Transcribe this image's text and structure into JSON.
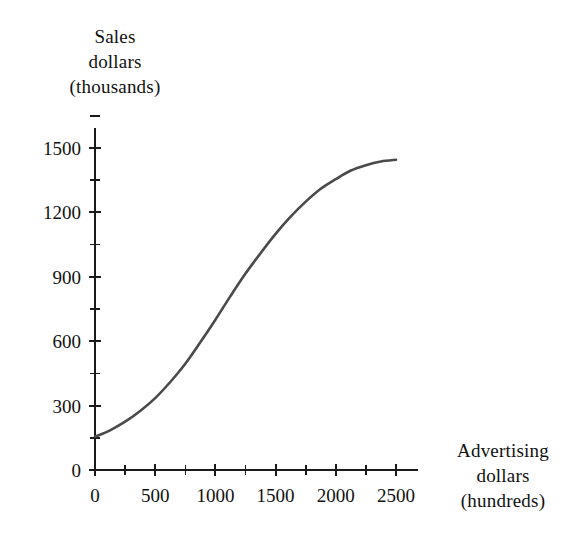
{
  "chart_data": {
    "type": "line",
    "title": "",
    "subtitle": "",
    "xlabel": "Advertising dollars (hundreds)",
    "ylabel": "Sales dollars (thousands)",
    "xlim": [
      0,
      2650
    ],
    "ylim": [
      0,
      1650
    ],
    "grid": false,
    "legend": null,
    "x_tick_labels": [
      "0",
      "500",
      "1000",
      "1500",
      "2000",
      "2500"
    ],
    "x_tick_values": [
      0,
      500,
      1000,
      1500,
      2000,
      2500
    ],
    "x_minor_tick_values": [
      250,
      750,
      1250,
      1750,
      2250
    ],
    "y_tick_labels": [
      "0",
      "300",
      "600",
      "900",
      "1200",
      "1500"
    ],
    "y_tick_values": [
      0,
      300,
      600,
      900,
      1200,
      1500
    ],
    "y_minor_tick_values": [
      150,
      450,
      750,
      1050,
      1350,
      1650
    ],
    "series": [
      {
        "name": "Sales response to advertising",
        "color": "#4a4a4a",
        "x": [
          0,
          125,
          250,
          375,
          500,
          625,
          750,
          875,
          1000,
          1125,
          1250,
          1375,
          1500,
          1625,
          1750,
          1875,
          2000,
          2125,
          2250,
          2375,
          2500
        ],
        "y": [
          155,
          185,
          225,
          275,
          335,
          410,
          495,
          595,
          700,
          810,
          915,
          1010,
          1100,
          1180,
          1250,
          1310,
          1355,
          1395,
          1420,
          1437,
          1445
        ]
      }
    ],
    "annotations": []
  },
  "labels": {
    "y_axis_title_lines": [
      "Sales",
      "dollars",
      "(thousands)"
    ],
    "x_axis_title_lines": [
      "Advertising",
      "dollars",
      "(hundreds)"
    ]
  },
  "colors": {
    "curve": "#4a4a4a",
    "axis": "#1a1a1a",
    "text": "#111111",
    "background": "#ffffff"
  }
}
